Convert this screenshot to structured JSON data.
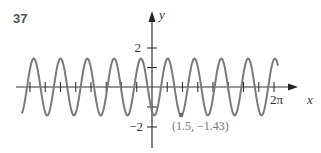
{
  "problem_number": "37",
  "chart_data": {
    "type": "line",
    "title": "",
    "xlabel": "x",
    "ylabel": "y",
    "x_tick_label": "2π",
    "y_tick_labels": [
      "2",
      "−2"
    ],
    "annotation": "(1.5, −1.43)",
    "annotation_point": {
      "x": 1.5,
      "y": -1.43
    },
    "xlim": [
      -4.0,
      6.283
    ],
    "ylim": [
      -3,
      3
    ],
    "amplitude": 1.45,
    "periods_visible": 7,
    "grid": false,
    "legend": null,
    "curve_color": "#777777",
    "axis_color": "#333333"
  }
}
